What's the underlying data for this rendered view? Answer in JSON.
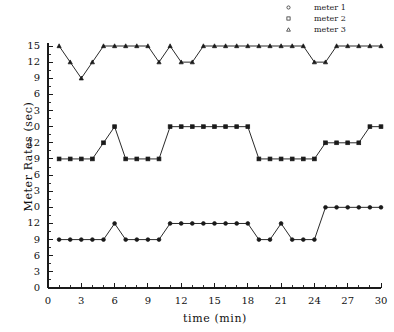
{
  "chart_data": {
    "type": "line",
    "title": "",
    "xlabel": "time (min)",
    "ylabel": "Meter Rates (sec)",
    "xlim": [
      0,
      30
    ],
    "xticks": [
      0,
      3,
      6,
      9,
      12,
      15,
      18,
      21,
      24,
      27,
      30
    ],
    "xtick_labels": [
      "0",
      "3",
      "6",
      "9",
      "12",
      "15",
      "18",
      "21",
      "24",
      "27",
      "30"
    ],
    "x_minor_step": 1,
    "grid": false,
    "legend_position": "top-right",
    "panels": [
      {
        "name": "meter 3 panel",
        "ytick_labels": [
          "15",
          "12",
          "9",
          "6",
          "3",
          "0"
        ],
        "ytick_values": [
          15,
          12,
          9,
          6,
          3,
          0
        ]
      },
      {
        "name": "meter 2 panel",
        "ytick_labels": [
          "12",
          "9",
          "6",
          "3",
          "0"
        ],
        "ytick_values": [
          12,
          9,
          6,
          3,
          0
        ]
      },
      {
        "name": "meter 1 panel",
        "ytick_labels": [
          "12",
          "9",
          "6",
          "3",
          "0"
        ],
        "ytick_values": [
          12,
          9,
          6,
          3,
          0
        ]
      }
    ],
    "x": [
      1,
      2,
      3,
      4,
      5,
      6,
      7,
      8,
      9,
      10,
      11,
      12,
      13,
      14,
      15,
      16,
      17,
      18,
      19,
      20,
      21,
      22,
      23,
      24,
      25,
      26,
      27,
      28,
      29,
      30
    ],
    "series": [
      {
        "name": "meter 3",
        "marker": "triangle",
        "panel": 0,
        "values": [
          15,
          12,
          9,
          12,
          15,
          15,
          15,
          15,
          15,
          12,
          15,
          12,
          12,
          15,
          15,
          15,
          15,
          15,
          15,
          15,
          15,
          15,
          15,
          12,
          12,
          15,
          15,
          15,
          15,
          15
        ]
      },
      {
        "name": "meter 2",
        "marker": "square",
        "panel": 1,
        "values": [
          9,
          9,
          9,
          9,
          12,
          15,
          9,
          9,
          9,
          9,
          15,
          15,
          15,
          15,
          15,
          15,
          15,
          15,
          9,
          9,
          9,
          9,
          9,
          9,
          12,
          12,
          12,
          12,
          15,
          15
        ]
      },
      {
        "name": "meter 1",
        "marker": "circle",
        "panel": 2,
        "values": [
          9,
          9,
          9,
          9,
          9,
          12,
          9,
          9,
          9,
          9,
          12,
          12,
          12,
          12,
          12,
          12,
          12,
          12,
          9,
          9,
          12,
          9,
          9,
          9,
          15,
          15,
          15,
          15,
          15,
          15
        ]
      }
    ]
  },
  "legend": {
    "entries": [
      {
        "label": "meter 1",
        "marker": "circle"
      },
      {
        "label": "meter 2",
        "marker": "square"
      },
      {
        "label": "meter 3",
        "marker": "triangle"
      }
    ]
  },
  "colors": {
    "line": "#2a2a2a",
    "marker": "#1a1a1a",
    "axis": "#1a1a1a",
    "background": "#ffffff",
    "text": "#111111"
  }
}
